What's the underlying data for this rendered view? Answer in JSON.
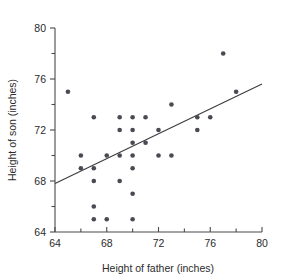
{
  "chart_data": {
    "type": "scatter",
    "title": "",
    "xlabel": "Height of father (inches)",
    "ylabel": "Height of son (inches)",
    "xlim": [
      64,
      80
    ],
    "ylim": [
      64,
      80
    ],
    "xticks": [
      64,
      68,
      72,
      76,
      80
    ],
    "xtick_labels": [
      "64",
      "68",
      "72",
      "76",
      "80"
    ],
    "xminor_ticks": [
      66,
      70,
      74,
      78
    ],
    "yticks": [
      64,
      68,
      72,
      76,
      80
    ],
    "ytick_labels": [
      "64",
      "68",
      "72",
      "76",
      "80"
    ],
    "yminor_ticks": [
      66,
      70,
      74,
      78
    ],
    "grid": false,
    "legend": null,
    "marker": "filled-circle",
    "marker_color": "#4a4a52",
    "points": [
      [
        65,
        75
      ],
      [
        66,
        70
      ],
      [
        66,
        69
      ],
      [
        67,
        73
      ],
      [
        67,
        69
      ],
      [
        67,
        68
      ],
      [
        67,
        66
      ],
      [
        67,
        65
      ],
      [
        68,
        70
      ],
      [
        68,
        65
      ],
      [
        69,
        73
      ],
      [
        69,
        72
      ],
      [
        69,
        70
      ],
      [
        69,
        68
      ],
      [
        70,
        73
      ],
      [
        70,
        72
      ],
      [
        70,
        71
      ],
      [
        70,
        70
      ],
      [
        70,
        69
      ],
      [
        70,
        67
      ],
      [
        70,
        65
      ],
      [
        71,
        73
      ],
      [
        71,
        71
      ],
      [
        72,
        72
      ],
      [
        72,
        70
      ],
      [
        73,
        74
      ],
      [
        73,
        70
      ],
      [
        75,
        73
      ],
      [
        75,
        72
      ],
      [
        76,
        73
      ],
      [
        77,
        78
      ],
      [
        78,
        75
      ]
    ],
    "trend_line": {
      "type": "linear-fit",
      "x_start": 64,
      "y_start": 67.8,
      "x_end": 80,
      "y_end": 75.6,
      "color": "#3c3c3c"
    }
  },
  "axes": {
    "x_title": "Height of father (inches)",
    "y_title": "Height of son (inches)"
  }
}
